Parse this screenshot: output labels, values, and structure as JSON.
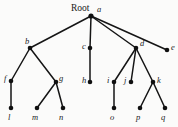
{
  "figure": {
    "type": "tree-diagram",
    "root_caption": "Root",
    "width": 178,
    "height": 127,
    "background_color": "#fbfbfa",
    "edge_color": "#151515",
    "node_color": "#101010",
    "label_color": "#1a1a1a"
  },
  "nodes": [
    {
      "id": "a",
      "label": "a",
      "x": 91,
      "y": 16,
      "label_x": 97,
      "label_y": 5,
      "level": 0
    },
    {
      "id": "b",
      "label": "b",
      "x": 30,
      "y": 48,
      "label_x": 25,
      "label_y": 37,
      "level": 1
    },
    {
      "id": "c",
      "label": "c",
      "x": 90,
      "y": 48,
      "label_x": 82,
      "label_y": 42,
      "level": 1
    },
    {
      "id": "d",
      "label": "d",
      "x": 136,
      "y": 48,
      "label_x": 140,
      "label_y": 39,
      "level": 1
    },
    {
      "id": "e",
      "label": "e",
      "x": 167,
      "y": 50,
      "label_x": 171,
      "label_y": 43,
      "level": 1
    },
    {
      "id": "f",
      "label": "f",
      "x": 11,
      "y": 81,
      "label_x": 4,
      "label_y": 74,
      "level": 2
    },
    {
      "id": "g",
      "label": "g",
      "x": 56,
      "y": 82,
      "label_x": 59,
      "label_y": 74,
      "level": 2
    },
    {
      "id": "h",
      "label": "h",
      "x": 90,
      "y": 82,
      "label_x": 82,
      "label_y": 76,
      "level": 2
    },
    {
      "id": "i",
      "label": "i",
      "x": 114,
      "y": 82,
      "label_x": 107,
      "label_y": 76,
      "level": 2
    },
    {
      "id": "j",
      "label": "j",
      "x": 131,
      "y": 82,
      "label_x": 124,
      "label_y": 76,
      "level": 2
    },
    {
      "id": "k",
      "label": "k",
      "x": 153,
      "y": 82,
      "label_x": 157,
      "label_y": 76,
      "level": 2
    },
    {
      "id": "l",
      "label": "l",
      "x": 11,
      "y": 108,
      "label_x": 8,
      "label_y": 113,
      "level": 3
    },
    {
      "id": "m",
      "label": "m",
      "x": 37,
      "y": 108,
      "label_x": 32,
      "label_y": 113,
      "level": 3
    },
    {
      "id": "n",
      "label": "n",
      "x": 63,
      "y": 108,
      "label_x": 59,
      "label_y": 113,
      "level": 3
    },
    {
      "id": "o",
      "label": "o",
      "x": 114,
      "y": 108,
      "label_x": 110,
      "label_y": 113,
      "level": 3
    },
    {
      "id": "p",
      "label": "p",
      "x": 140,
      "y": 108,
      "label_x": 136,
      "label_y": 113,
      "level": 3
    },
    {
      "id": "q",
      "label": "q",
      "x": 165,
      "y": 108,
      "label_x": 161,
      "label_y": 113,
      "level": 3
    }
  ],
  "edges": [
    {
      "from": "a",
      "to": "b"
    },
    {
      "from": "a",
      "to": "c"
    },
    {
      "from": "a",
      "to": "d"
    },
    {
      "from": "a",
      "to": "e"
    },
    {
      "from": "b",
      "to": "f"
    },
    {
      "from": "b",
      "to": "g"
    },
    {
      "from": "c",
      "to": "h"
    },
    {
      "from": "d",
      "to": "i"
    },
    {
      "from": "d",
      "to": "j"
    },
    {
      "from": "d",
      "to": "k"
    },
    {
      "from": "f",
      "to": "l"
    },
    {
      "from": "g",
      "to": "m"
    },
    {
      "from": "g",
      "to": "n"
    },
    {
      "from": "i",
      "to": "o"
    },
    {
      "from": "k",
      "to": "p"
    },
    {
      "from": "k",
      "to": "q"
    }
  ],
  "root_caption_position": {
    "x": 71,
    "y": 4
  }
}
